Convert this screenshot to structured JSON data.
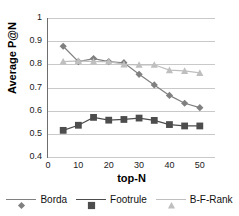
{
  "chart_data": {
    "type": "line",
    "title": "",
    "xlabel": "top-N",
    "ylabel": "Average P@N",
    "x": [
      5,
      10,
      15,
      20,
      25,
      30,
      35,
      40,
      45,
      50
    ],
    "xlim": [
      0,
      55
    ],
    "ylim": [
      0.4,
      1.0
    ],
    "xticks": [
      "0",
      "10",
      "20",
      "30",
      "40",
      "50"
    ],
    "xtick_values": [
      0,
      10,
      20,
      30,
      40,
      50
    ],
    "yticks": [
      "0.4",
      "0.5",
      "0.6",
      "0.7",
      "0.8",
      "0.9",
      "1"
    ],
    "ytick_values": [
      0.4,
      0.5,
      0.6,
      0.7,
      0.8,
      0.9,
      1.0
    ],
    "grid": "horizontal",
    "legend_position": "bottom",
    "series": [
      {
        "name": "Borda",
        "marker": "diamond",
        "color": "#808080",
        "values": [
          0.878,
          0.812,
          0.825,
          0.812,
          0.807,
          0.757,
          0.711,
          0.666,
          0.632,
          0.613
        ]
      },
      {
        "name": "Footrule",
        "marker": "square",
        "color": "#4d4d4d",
        "values": [
          0.515,
          0.537,
          0.571,
          0.559,
          0.562,
          0.568,
          0.558,
          0.54,
          0.534,
          0.534
        ]
      },
      {
        "name": "B-F-Rank",
        "marker": "triangle",
        "color": "#bfbfbf",
        "values": [
          0.812,
          0.815,
          0.812,
          0.812,
          0.8,
          0.798,
          0.798,
          0.775,
          0.772,
          0.763
        ]
      }
    ]
  },
  "legend": {
    "items": [
      {
        "label": "Borda",
        "marker": "diamond-marker",
        "color": "#808080"
      },
      {
        "label": "Footrule",
        "marker": "square-marker",
        "color": "#4d4d4d"
      },
      {
        "label": "B-F-Rank",
        "marker": "triangle-marker",
        "color": "#bfbfbf"
      }
    ]
  }
}
